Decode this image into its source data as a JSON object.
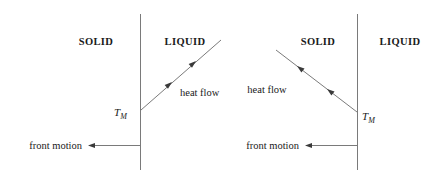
{
  "figure": {
    "background_color": "#ffffff",
    "line_color": "#666666",
    "text_color": "#1a1a1a"
  },
  "panels": [
    {
      "id": "left-panel",
      "solid_label": "SOLID",
      "liquid_label": "LIQUID",
      "heat_flow_label": "heat flow",
      "front_motion_label": "front motion",
      "interface_temp_label": "T",
      "interface_temp_subscript": "M",
      "heat_flow_direction": "down-left",
      "front_motion_direction": "left"
    },
    {
      "id": "right-panel",
      "solid_label": "SOLID",
      "liquid_label": "LIQUID",
      "heat_flow_label": "heat flow",
      "front_motion_label": "front motion",
      "interface_temp_label": "T",
      "interface_temp_subscript": "M",
      "heat_flow_direction": "down-right",
      "front_motion_direction": "left"
    }
  ]
}
